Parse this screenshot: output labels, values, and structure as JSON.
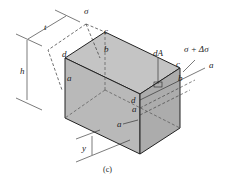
{
  "figure": {
    "caption": "(c)",
    "labels": {
      "sigma": "σ",
      "sigma_plus_delta": "σ + Δσ",
      "dA": "dA",
      "t": "t",
      "h": "h",
      "y": "y",
      "a_top_left": "a",
      "a_right": "a",
      "a_front": "a",
      "a_front_low": "a",
      "b_top": "b",
      "b_right": "b",
      "c_top": "c",
      "c_right": "c",
      "d_top": "d",
      "d_front": "d"
    },
    "colors": {
      "box_front": "#b9b9b9",
      "box_top": "#c4c4c4",
      "box_side": "#acacac",
      "line": "#222222"
    }
  }
}
